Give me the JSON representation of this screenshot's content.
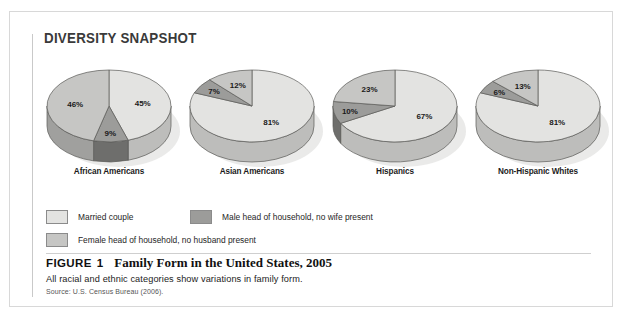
{
  "panel": {
    "title": "DIVERSITY SNAPSHOT"
  },
  "colors": {
    "married_top": "#e3e3e1",
    "married_side": "#bdbdbb",
    "male_top": "#9c9c9a",
    "male_side": "#6e6e6c",
    "female_top": "#c6c6c4",
    "female_side": "#a0a09e",
    "outline": "#5a5a58",
    "panel_border": "#d8d8d8",
    "rule": "#c9c9c9",
    "text": "#1c1c1c"
  },
  "legend": {
    "items": [
      {
        "label": "Married couple",
        "key": "married",
        "swatch": "#e3e3e1"
      },
      {
        "label": "Male head of household, no wife present",
        "key": "male",
        "swatch": "#9c9c9a"
      },
      {
        "label": "Female head of household, no husband present",
        "key": "female",
        "swatch": "#c6c6c4"
      }
    ]
  },
  "caption": {
    "figure_word": "FIGURE",
    "figure_number": "1",
    "title": "Family Form in the United States, 2005",
    "subtitle": "All racial and ethnic categories show variations in family form.",
    "source": "Source: U.S. Census Bureau (2006)."
  },
  "chart_data": {
    "type": "pie",
    "title": "Family Form in the United States, 2005",
    "subtitle": "All racial and ethnic categories show variations in family form.",
    "source": "Source: U.S. Census Bureau (2006).",
    "units": "percent",
    "legend_position": "bottom-left",
    "series_names": [
      "Married couple",
      "Male head of household, no wife present",
      "Female head of household, no husband present"
    ],
    "charts": [
      {
        "name": "African Americans",
        "slices": [
          {
            "label": "Married couple",
            "key": "married",
            "value": 45,
            "display": "45%"
          },
          {
            "label": "Male head of household, no wife present",
            "key": "male",
            "value": 9,
            "display": "9%"
          },
          {
            "label": "Female head of household, no husband present",
            "key": "female",
            "value": 46,
            "display": "46%"
          }
        ]
      },
      {
        "name": "Asian Americans",
        "slices": [
          {
            "label": "Married couple",
            "key": "married",
            "value": 81,
            "display": "81%"
          },
          {
            "label": "Male head of household, no wife present",
            "key": "male",
            "value": 7,
            "display": "7%"
          },
          {
            "label": "Female head of household, no husband present",
            "key": "female",
            "value": 12,
            "display": "12%"
          }
        ]
      },
      {
        "name": "Hispanics",
        "slices": [
          {
            "label": "Married couple",
            "key": "married",
            "value": 67,
            "display": "67%"
          },
          {
            "label": "Male head of household, no wife present",
            "key": "male",
            "value": 10,
            "display": "10%"
          },
          {
            "label": "Female head of household, no husband present",
            "key": "female",
            "value": 23,
            "display": "23%"
          }
        ]
      },
      {
        "name": "Non-Hispanic Whites",
        "slices": [
          {
            "label": "Married couple",
            "key": "married",
            "value": 81,
            "display": "81%"
          },
          {
            "label": "Male head of household, no wife present",
            "key": "male",
            "value": 6,
            "display": "6%"
          },
          {
            "label": "Female head of household, no husband present",
            "key": "female",
            "value": 13,
            "display": "13%"
          }
        ]
      }
    ]
  }
}
